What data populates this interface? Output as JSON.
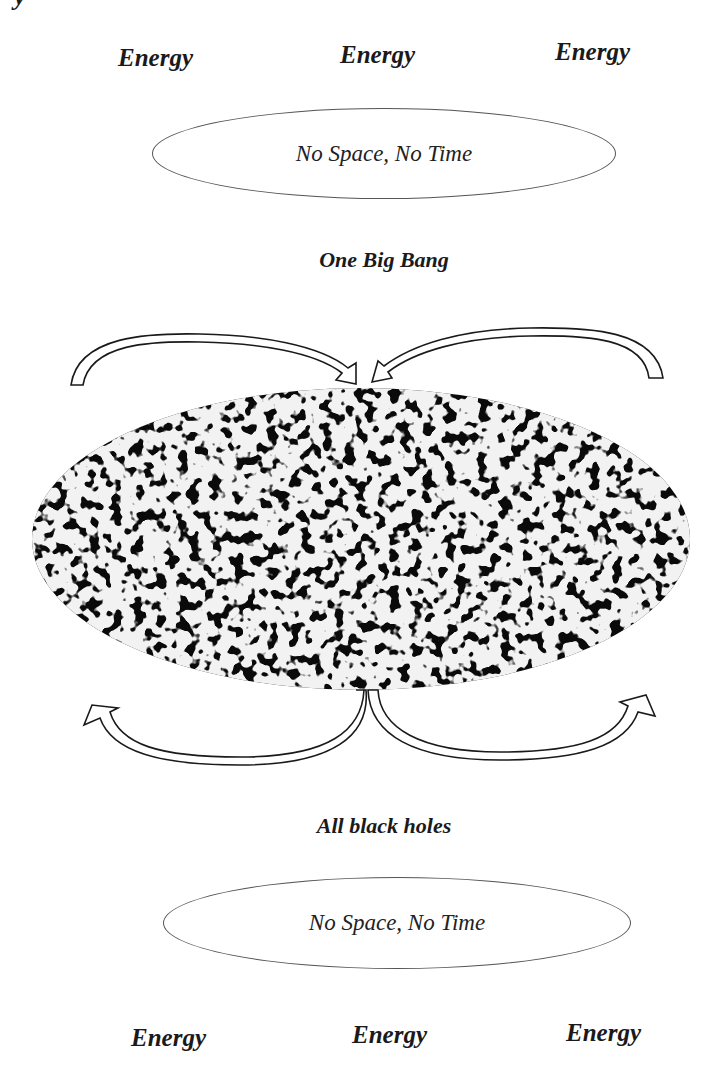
{
  "corner_fragment": "y",
  "top": {
    "energy_labels": [
      "Energy",
      "Energy",
      "Energy"
    ],
    "oval_text": "No Space, No Time",
    "caption": "One Big Bang"
  },
  "center": {
    "universe_image": "cosmic-microwave-background-map",
    "top_arrows": [
      "arrow-converging-left",
      "arrow-converging-right"
    ],
    "bottom_arrows": [
      "arrow-diverging-left",
      "arrow-diverging-right"
    ]
  },
  "bottom": {
    "caption": "All black holes",
    "oval_text": "No Space, No Time",
    "energy_labels": [
      "Energy",
      "Energy",
      "Energy"
    ]
  },
  "colors": {
    "ink": "#1a1a1a",
    "universe_fill": "#0a0a0a",
    "speckle": "#ffffff"
  }
}
